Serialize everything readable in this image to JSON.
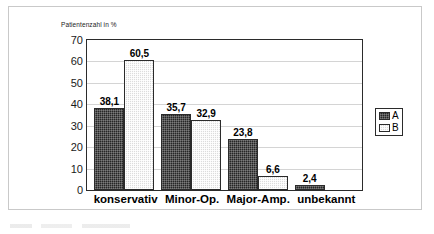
{
  "chart_data": {
    "type": "bar",
    "title": "",
    "subtitle": "",
    "ylabel": "Patientenzahl in %",
    "xlabel": "",
    "categories": [
      "konservativ",
      "Minor-Op.",
      "Major-Amp.",
      "unbekannt"
    ],
    "series": [
      {
        "name": "A",
        "values": [
          38.1,
          35.7,
          23.8,
          2.4
        ],
        "labels": [
          "38,1",
          "35,7",
          "23,8",
          "2,4"
        ],
        "color": "#262626"
      },
      {
        "name": "B",
        "values": [
          60.5,
          32.9,
          6.6,
          null
        ],
        "labels": [
          "60,5",
          "32,9",
          "6,6",
          ""
        ],
        "color": "#dcdcdc"
      }
    ],
    "ylim": [
      0,
      70
    ],
    "yticks": [
      70,
      60,
      50,
      40,
      30,
      20,
      10,
      0
    ],
    "ytick_labels": [
      "70",
      "60",
      "50",
      "40",
      "30",
      "20",
      "10",
      "0"
    ],
    "grid": true,
    "legend_position": "right",
    "legend_entries": [
      "A",
      "B"
    ]
  },
  "legend": {
    "a_label": "A",
    "b_label": "B"
  },
  "colors": {
    "series_a": "#262626",
    "series_b": "#dcdcdc",
    "axis": "#2b2b2b",
    "grid": "#d4d4d4",
    "frame": "#c9c9c9"
  }
}
